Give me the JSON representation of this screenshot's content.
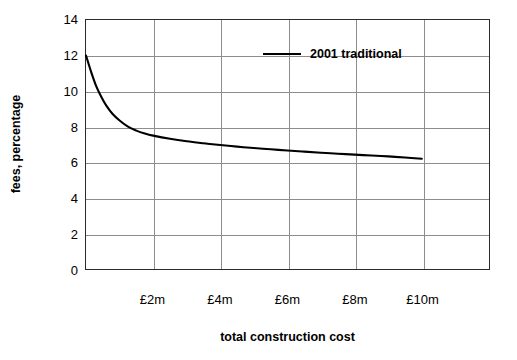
{
  "chart_data": {
    "type": "line",
    "title": "",
    "xlabel": "total construction cost",
    "ylabel": "fees, percentage",
    "xlim": [
      0,
      12
    ],
    "ylim": [
      0,
      14
    ],
    "ytick_values": [
      14,
      12,
      10,
      8,
      6,
      4,
      2,
      0
    ],
    "ytick_labels": [
      "14",
      "12",
      "10",
      "8",
      "6",
      "4",
      "2",
      "0"
    ],
    "xtick_values": [
      2,
      4,
      6,
      8,
      10
    ],
    "xtick_labels": [
      "£2m",
      "£4m",
      "£6m",
      "£8m",
      "£10m"
    ],
    "grid": true,
    "legend_position": "top-center",
    "series": [
      {
        "name": "2001 traditional",
        "color": "#000000",
        "x": [
          0.0,
          0.15,
          0.3,
          0.45,
          0.6,
          0.8,
          1.0,
          1.25,
          1.5,
          1.75,
          2.0,
          2.5,
          3.0,
          3.5,
          4.0,
          4.5,
          5.0,
          5.5,
          6.0,
          6.5,
          7.0,
          7.5,
          8.0,
          8.5,
          9.0,
          9.5,
          10.0
        ],
        "y": [
          12.0,
          11.1,
          10.3,
          9.7,
          9.2,
          8.7,
          8.35,
          8.0,
          7.78,
          7.62,
          7.5,
          7.32,
          7.18,
          7.07,
          6.97,
          6.88,
          6.8,
          6.73,
          6.66,
          6.6,
          6.54,
          6.48,
          6.43,
          6.38,
          6.33,
          6.27,
          6.2
        ]
      }
    ]
  },
  "legend": {
    "entries": [
      {
        "label": "2001 traditional"
      }
    ]
  }
}
